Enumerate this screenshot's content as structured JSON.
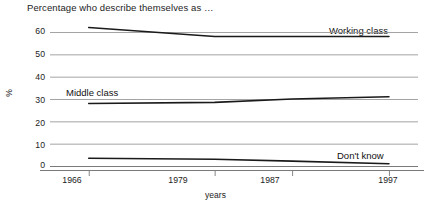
{
  "chart_data": {
    "type": "line",
    "title": "Percentage who describe themselves as …",
    "xlabel": "years",
    "ylabel": "%",
    "x": [
      1966,
      1979,
      1987,
      1997
    ],
    "xticklabels": [
      "1966",
      "1979",
      "1987",
      "1997"
    ],
    "yticklabels": [
      "60",
      "50",
      "40",
      "30",
      "20",
      "10",
      "0"
    ],
    "yticks": [
      60,
      50,
      40,
      30,
      20,
      10,
      0
    ],
    "ylim": [
      0,
      60
    ],
    "xlim": [
      1962,
      2000
    ],
    "grid": true,
    "legend_position": "inline-labels",
    "series": [
      {
        "name": "Working class",
        "label": "Working class",
        "values": [
          62,
          58,
          58,
          58
        ],
        "color": "#1a1a1a"
      },
      {
        "name": "Middle class",
        "label": "Middle class",
        "values": [
          28,
          28.5,
          30,
          31
        ],
        "color": "#1a1a1a"
      },
      {
        "name": "Don't know",
        "label": "Don't know",
        "values": [
          3.5,
          3,
          2.2,
          1
        ],
        "color": "#1a1a1a"
      }
    ]
  },
  "style": {
    "grid_color": "#9a9a9a",
    "axis_color": "#7a7a7a",
    "line_color": "#1a1a1a",
    "background": "#ffffff"
  }
}
